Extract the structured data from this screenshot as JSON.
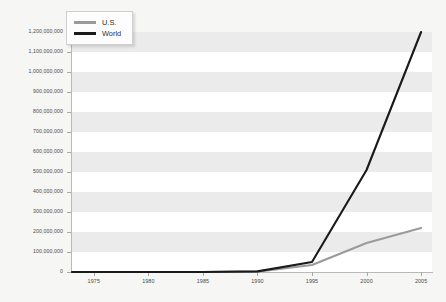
{
  "chart_data": {
    "type": "line",
    "title": "",
    "subtitle": "",
    "xlabel": "",
    "ylabel": "",
    "x": [
      1973,
      1975,
      1980,
      1985,
      1990,
      1995,
      2000,
      2005
    ],
    "xlim": [
      1973,
      2006
    ],
    "ylim": [
      0,
      1200000000
    ],
    "xticks": [
      1975,
      1980,
      1985,
      1990,
      1995,
      2000,
      2005
    ],
    "xtick_labels": [
      "1975",
      "1980",
      "1985",
      "1990",
      "1995",
      "2000",
      "2005"
    ],
    "yticks": [
      0,
      100000000,
      200000000,
      300000000,
      400000000,
      500000000,
      600000000,
      700000000,
      800000000,
      900000000,
      1000000000,
      1100000000,
      1200000000
    ],
    "ytick_labels": [
      "0",
      "100,000,000",
      "200,000,000",
      "300,000,000",
      "400,000,000",
      "500,000,000",
      "600,000,000",
      "700,000,000",
      "800,000,000",
      "900,000,000",
      "1,000,000,000",
      "1,100,000,000",
      "1,200,000,000"
    ],
    "grid": "horizontal-bands",
    "legend_position": "top-left",
    "series": [
      {
        "name": "U.S.",
        "color": "#9a9a9a",
        "values": [
          0,
          0,
          0,
          0,
          2000000,
          35000000,
          145000000,
          220000000
        ]
      },
      {
        "name": "World",
        "color": "#1a1a1a",
        "values": [
          0,
          0,
          0,
          0,
          3000000,
          50000000,
          510000000,
          1200000000
        ]
      }
    ]
  },
  "legend": {
    "items": [
      {
        "label": "U.S.",
        "color": "#9a9a9a"
      },
      {
        "label": "World",
        "color": "#1a1a1a"
      }
    ]
  },
  "colors": {
    "page_background": "#f6f6f4",
    "plot_background": "#ffffff",
    "band": "#ebebeb",
    "axis": "#b9b9b9",
    "tick_label": "#4a4a4a",
    "us_series": "#9a9a9a",
    "world_series": "#1a1a1a"
  }
}
